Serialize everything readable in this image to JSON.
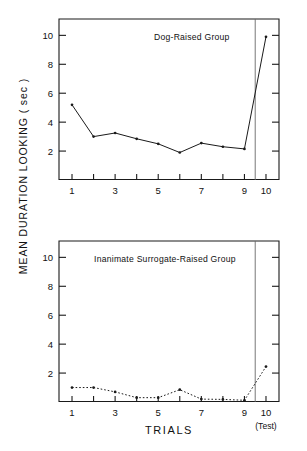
{
  "figure": {
    "ylabel": "MEAN DURATION LOOKING ( sec )",
    "xlabel": "TRIALS",
    "test_note": "(Test)",
    "axis_color": "#1a1a1a",
    "line_color": "#1a1a1a",
    "background": "#ffffff"
  },
  "chart_data": [
    {
      "type": "line",
      "title": "Dog-Raised Group",
      "xlabel": "TRIALS",
      "ylabel": "MEAN DURATION LOOKING ( sec )",
      "x": [
        1,
        2,
        3,
        4,
        5,
        6,
        7,
        8,
        9,
        10
      ],
      "values": [
        5.2,
        3.0,
        3.25,
        2.85,
        2.5,
        1.9,
        2.55,
        2.3,
        2.15,
        9.9
      ],
      "xtick_values": [
        1,
        3,
        5,
        7,
        9,
        10
      ],
      "xtick_labels": [
        "1",
        "3",
        "5",
        "7",
        "9",
        "10"
      ],
      "ytick_values": [
        2,
        4,
        6,
        8,
        10
      ],
      "ytick_labels": [
        "2",
        "4",
        "6",
        "8",
        "10"
      ],
      "xlim": [
        0.35,
        10.65
      ],
      "ylim": [
        0,
        11.2
      ],
      "grid": false,
      "legend": "none",
      "linestyle": "solid",
      "marker": "dot",
      "annotations": [
        {
          "name": "test-separator",
          "type": "vline",
          "x": 9.5
        }
      ]
    },
    {
      "type": "line",
      "title": "Inanimate Surrogate-Raised Group",
      "xlabel": "TRIALS",
      "ylabel": "MEAN DURATION LOOKING ( sec )",
      "x": [
        1,
        2,
        3,
        4,
        5,
        6,
        7,
        8,
        9,
        10
      ],
      "values": [
        1.0,
        1.0,
        0.7,
        0.3,
        0.3,
        0.85,
        0.2,
        0.18,
        0.12,
        2.45
      ],
      "xtick_values": [
        1,
        3,
        5,
        7,
        9,
        10
      ],
      "xtick_labels": [
        "1",
        "3",
        "5",
        "7",
        "9",
        "10"
      ],
      "ytick_values": [
        2,
        4,
        6,
        8,
        10
      ],
      "ytick_labels": [
        "2",
        "4",
        "6",
        "8",
        "10"
      ],
      "xlim": [
        0.35,
        10.65
      ],
      "ylim": [
        0,
        11.2
      ],
      "grid": false,
      "legend": "none",
      "linestyle": "dotted",
      "marker": "dot",
      "annotations": [
        {
          "name": "test-separator",
          "type": "vline",
          "x": 9.5
        },
        {
          "name": "test-trial-note",
          "type": "text",
          "x": 10,
          "text": "(Test)"
        }
      ]
    }
  ]
}
